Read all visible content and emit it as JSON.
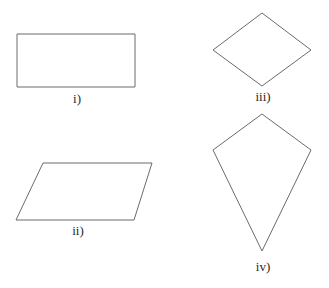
{
  "stroke_color": "#6b6b6b",
  "background": "#ffffff",
  "shapes": [
    {
      "name": "rectangle",
      "label": "i)",
      "points": "17,34 135,34 135,87 17,87",
      "label_pos": {
        "x": 77,
        "y": 92
      }
    },
    {
      "name": "parallelogram",
      "label": "ii)",
      "points": "43,163 152,163 134,220 16,220",
      "label_pos": {
        "x": 78,
        "y": 224
      }
    },
    {
      "name": "rhombus",
      "label": "iii)",
      "points": "262,13 311,50 262,86 213,50",
      "label_pos": {
        "x": 263,
        "y": 90
      }
    },
    {
      "name": "kite",
      "label": "iv)",
      "points": "262,114 311,150 262,251 213,150",
      "label_pos": {
        "x": 263,
        "y": 260
      }
    }
  ]
}
